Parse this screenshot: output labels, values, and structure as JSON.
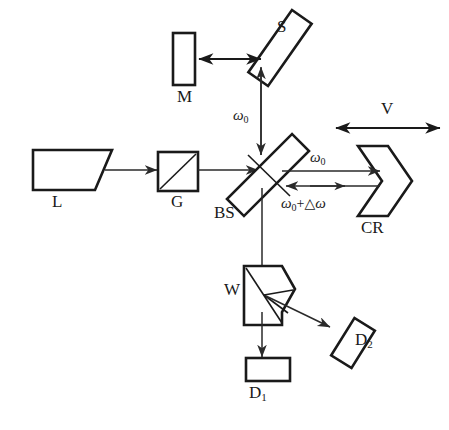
{
  "figure": {
    "type": "optical-schematic",
    "background_color": "#ffffff",
    "line_color": "#1a1a1a"
  },
  "components": {
    "laser": {
      "label": "L",
      "name": "laser-source",
      "shape": "trapezoid"
    },
    "grating": {
      "label": "G",
      "name": "grating-modulator",
      "shape": "square-with-diagonal"
    },
    "beamsplitter": {
      "label": "BS",
      "name": "beam-splitter",
      "shape": "tilted-rectangle"
    },
    "mirror_s": {
      "label": "S",
      "name": "scanning-mirror",
      "shape": "tilted-rectangle"
    },
    "mirror_m": {
      "label": "M",
      "name": "reference-mirror",
      "shape": "vertical-rectangle"
    },
    "corner_reflector": {
      "label": "CR",
      "name": "corner-reflector",
      "shape": "chevron"
    },
    "wollaston": {
      "label": "W",
      "name": "wollaston-prism",
      "shape": "prism"
    },
    "detector_1": {
      "label": "D",
      "subscript": "1",
      "name": "detector-one",
      "shape": "rectangle"
    },
    "detector_2": {
      "label": "D",
      "subscript": "2",
      "name": "detector-two",
      "shape": "tilted-rectangle"
    }
  },
  "annotations": {
    "omega_ref": {
      "symbol": "ω",
      "subscript": "0",
      "description": "reference beam frequency toward S mirror"
    },
    "omega_out": {
      "symbol": "ω",
      "subscript": "0",
      "description": "outgoing beam frequency toward CR"
    },
    "omega_shifted": {
      "symbol": "ω",
      "subscript": "0",
      "operator": "+",
      "delta": "△",
      "delta_symbol": "ω",
      "description": "Doppler shifted return beam frequency"
    },
    "velocity": {
      "label": "V",
      "description": "corner reflector translation velocity"
    }
  }
}
